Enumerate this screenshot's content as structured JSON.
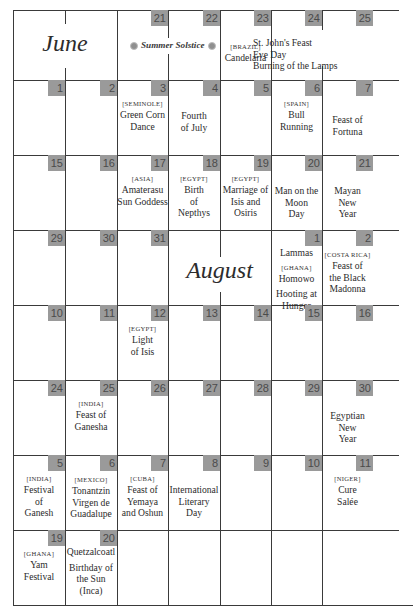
{
  "calendar": {
    "months": {
      "june": "June",
      "august": "August"
    },
    "solstice_label": "Summer Solstice",
    "colors": {
      "badge_bg": "#9a9a9a",
      "badge_text": "#4a4a4a",
      "grid_line": "#3a3a3a"
    },
    "weeks": [
      {
        "days": [
          {
            "span": "month-june"
          },
          {
            "date": "21"
          },
          {
            "date": "22"
          },
          {
            "date": "23",
            "tag": "[BRAZIL]",
            "lines": [
              "Candelaria"
            ]
          },
          {
            "date": "24",
            "lines": [
              "St. John's Feast",
              "Eve Day",
              "Burning of the Lamps"
            ]
          },
          {
            "date": "25"
          }
        ]
      },
      {
        "days": [
          {
            "date": "1"
          },
          {
            "date": "2"
          },
          {
            "date": "3",
            "tag": "[SEMINOLE]",
            "lines": [
              "Green Corn",
              "Dance"
            ]
          },
          {
            "date": "4",
            "lines": [
              "Fourth",
              "of July"
            ]
          },
          {
            "date": "5"
          },
          {
            "date": "6",
            "tag": "[SPAIN]",
            "lines": [
              "Bull Running"
            ]
          },
          {
            "date": "7",
            "lines": [
              "Feast of",
              "Fortuna"
            ]
          }
        ]
      },
      {
        "days": [
          {
            "date": "15"
          },
          {
            "date": "16"
          },
          {
            "date": "17",
            "tag": "[ASIA]",
            "lines": [
              "Amaterasu",
              "Sun Goddess"
            ]
          },
          {
            "date": "18",
            "tag": "[EGYPT]",
            "lines": [
              "Birth",
              "of",
              "Nepthys"
            ]
          },
          {
            "date": "19",
            "tag": "[EGYPT]",
            "lines": [
              "Marriage of",
              "Isis and",
              "Osiris"
            ]
          },
          {
            "date": "20",
            "lines": [
              "Man on the",
              "Moon",
              "Day"
            ]
          },
          {
            "date": "21",
            "lines": [
              "Mayan",
              "New",
              "Year"
            ]
          }
        ]
      },
      {
        "days": [
          {
            "date": "29"
          },
          {
            "date": "30"
          },
          {
            "date": "31"
          },
          {
            "span": "month-august"
          },
          {
            "date": "1",
            "lines": [
              "Lammas"
            ],
            "tag2": "[GHANA]",
            "lines2": [
              "Homowo"
            ],
            "lines3": [
              "Hooting at",
              "Hunger"
            ]
          },
          {
            "date": "2",
            "tag": "[COSTA RICA]",
            "lines": [
              "Feast of",
              "the Black",
              "Madonna"
            ]
          }
        ]
      },
      {
        "days": [
          {
            "date": "10"
          },
          {
            "date": "11"
          },
          {
            "date": "12",
            "tag": "[EGYPT]",
            "lines": [
              "Light",
              "of Isis"
            ]
          },
          {
            "date": "13"
          },
          {
            "date": "14"
          },
          {
            "date": "15"
          },
          {
            "date": "16"
          }
        ]
      },
      {
        "days": [
          {
            "date": "24"
          },
          {
            "date": "25",
            "tag": "[INDIA]",
            "lines": [
              "Feast of",
              "Ganesha"
            ]
          },
          {
            "date": "26"
          },
          {
            "date": "27"
          },
          {
            "date": "28"
          },
          {
            "date": "29"
          },
          {
            "date": "30",
            "lines": [
              "Egyptian",
              "New",
              "Year"
            ]
          }
        ]
      },
      {
        "days": [
          {
            "date": "5",
            "tag": "[INDIA]",
            "lines": [
              "Festival",
              "of",
              "Ganesh"
            ]
          },
          {
            "date": "6",
            "tag": "[MEXICO]",
            "lines": [
              "Tonantzin",
              "Virgen de",
              "Guadalupe"
            ]
          },
          {
            "date": "7",
            "tag": "[CUBA]",
            "lines": [
              "Feast of",
              "Yemaya",
              "and Oshun"
            ]
          },
          {
            "date": "8",
            "lines": [
              "International",
              "Literary",
              "Day"
            ]
          },
          {
            "date": "9"
          },
          {
            "date": "10"
          },
          {
            "date": "11",
            "tag": "[NIGER]",
            "lines": [
              "Cure",
              "Salée"
            ]
          }
        ]
      },
      {
        "days": [
          {
            "date": "19",
            "tag": "[GHANA]",
            "lines": [
              "Yam",
              "Festival"
            ]
          },
          {
            "date": "20",
            "lines": [
              "Quetzalcoatl"
            ],
            "lines2": [
              "Birthday of",
              "the Sun",
              "(Inca)"
            ]
          },
          {
            "date": ""
          },
          {
            "date": ""
          },
          {
            "date": ""
          },
          {
            "date": ""
          },
          {
            "date": ""
          }
        ]
      }
    ]
  }
}
